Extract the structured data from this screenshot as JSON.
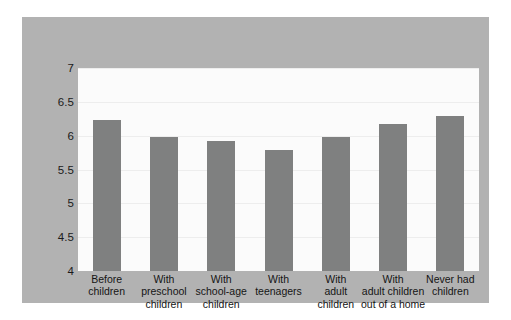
{
  "chart_data": {
    "type": "bar",
    "title": "",
    "subtitle": "",
    "xlabel": "",
    "ylabel": "",
    "categories": [
      "Before children",
      "With preschool children",
      "With school-age children",
      "With teenagers",
      "With adult children",
      "With adult children out of a home",
      "Never had children"
    ],
    "values": [
      6.23,
      5.98,
      5.92,
      5.79,
      5.98,
      6.18,
      6.29
    ],
    "ylim": [
      4,
      7
    ],
    "yticks": [
      4,
      4.5,
      5,
      5.5,
      6,
      6.5,
      7
    ],
    "ytick_labels": [
      "4",
      "4.5",
      "5",
      "5.5",
      "6",
      "6.5",
      "7"
    ],
    "grid": true,
    "legend": false,
    "legend_position": "none",
    "bar_color": "#7f8080",
    "plot_background": "#fbfbfb",
    "frame_background": "#b2b2b2",
    "gridline_color": "#ededed"
  },
  "labels": {
    "categories_display": [
      "Before\nchildren",
      "With\npreschool\nchildren",
      "With\nschool-age\nchildren",
      "With\nteenagers",
      "With\nadult\nchildren",
      "With\nadult children\nout of a home",
      "Never had\nchildren"
    ]
  }
}
